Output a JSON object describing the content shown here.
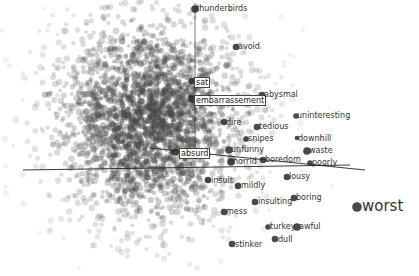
{
  "projector": {
    "colors": {
      "point": "#555555",
      "label_text": "#333333",
      "axis": "#222222",
      "background": "#ffffff"
    },
    "labels": [
      {
        "text": "thunderbirds",
        "x": 196,
        "y": 4,
        "boxed": false,
        "dot": [
          195,
          9,
          6
        ]
      },
      {
        "text": "avoid",
        "x": 238,
        "y": 42,
        "boxed": false,
        "dot": [
          236,
          47,
          5
        ]
      },
      {
        "text": "sat",
        "x": 194,
        "y": 77,
        "boxed": true,
        "dot": [
          192,
          81,
          5
        ]
      },
      {
        "text": "embarrassement",
        "x": 194,
        "y": 95,
        "boxed": true,
        "dot": [
          192,
          99,
          6
        ]
      },
      {
        "text": "abysmal",
        "x": 264,
        "y": 90,
        "boxed": false,
        "dot": [
          262,
          95,
          5
        ]
      },
      {
        "text": "uninteresting",
        "x": 297,
        "y": 111,
        "boxed": false,
        "dot": [
          296,
          116,
          4
        ]
      },
      {
        "text": "dire",
        "x": 226,
        "y": 118,
        "boxed": false,
        "dot": [
          224,
          122,
          5
        ]
      },
      {
        "text": "tedious",
        "x": 259,
        "y": 122,
        "boxed": false,
        "dot": [
          257,
          127,
          5
        ]
      },
      {
        "text": "snipes",
        "x": 248,
        "y": 134,
        "boxed": false,
        "dot": [
          246,
          139,
          4
        ]
      },
      {
        "text": "downhill",
        "x": 298,
        "y": 134,
        "boxed": false,
        "dot": [
          297,
          138,
          3
        ]
      },
      {
        "text": "unfunny",
        "x": 231,
        "y": 145,
        "boxed": false,
        "dot": [
          229,
          150,
          6
        ]
      },
      {
        "text": "waste",
        "x": 309,
        "y": 146,
        "boxed": false,
        "dot": [
          307,
          151,
          6
        ]
      },
      {
        "text": "absurd",
        "x": 179,
        "y": 148,
        "boxed": true,
        "dot": [
          175,
          152,
          6
        ]
      },
      {
        "text": "horrid",
        "x": 233,
        "y": 157,
        "boxed": false,
        "dot": [
          231,
          162,
          6
        ]
      },
      {
        "text": "boredom",
        "x": 265,
        "y": 155,
        "boxed": false,
        "dot": [
          263,
          160,
          5
        ]
      },
      {
        "text": "poorly",
        "x": 312,
        "y": 158,
        "boxed": false,
        "dot": [
          310,
          163,
          4
        ]
      },
      {
        "text": "lousy",
        "x": 289,
        "y": 172,
        "boxed": false,
        "dot": [
          287,
          177,
          5
        ]
      },
      {
        "text": "insult",
        "x": 211,
        "y": 176,
        "boxed": false,
        "dot": [
          208,
          180,
          5
        ]
      },
      {
        "text": "mildly",
        "x": 241,
        "y": 181,
        "boxed": false,
        "dot": [
          238,
          186,
          5
        ]
      },
      {
        "text": "boring",
        "x": 296,
        "y": 193,
        "boxed": false,
        "dot": [
          294,
          198,
          5
        ]
      },
      {
        "text": "insulting",
        "x": 258,
        "y": 197,
        "boxed": false,
        "dot": [
          255,
          202,
          5
        ]
      },
      {
        "text": "worst",
        "x": 362,
        "y": 198,
        "boxed": false,
        "big": true,
        "dot": [
          357,
          207,
          8
        ]
      },
      {
        "text": "mess",
        "x": 226,
        "y": 207,
        "boxed": false,
        "dot": [
          224,
          212,
          5
        ]
      },
      {
        "text": "turkey",
        "x": 270,
        "y": 222,
        "boxed": false,
        "dot": [
          268,
          227,
          4
        ]
      },
      {
        "text": "awful",
        "x": 299,
        "y": 222,
        "boxed": false,
        "dot": [
          297,
          227,
          6
        ]
      },
      {
        "text": "dull",
        "x": 278,
        "y": 235,
        "boxed": false,
        "dot": [
          275,
          239,
          5
        ]
      },
      {
        "text": "stinker",
        "x": 235,
        "y": 240,
        "boxed": false,
        "dot": [
          232,
          244,
          5
        ]
      }
    ]
  }
}
